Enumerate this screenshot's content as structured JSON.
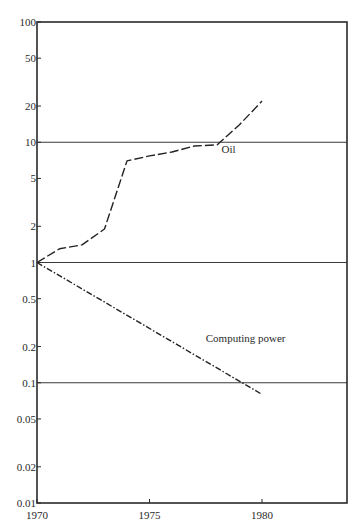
{
  "chart_data": {
    "type": "line",
    "title": "",
    "xlabel": "",
    "ylabel": "",
    "yscale": "log",
    "xlim": [
      1970,
      1984
    ],
    "ylim": [
      0.01,
      100
    ],
    "grid": "horizontal lines at 1-decade marks (10, 1, 0.1)",
    "x_ticks": [
      1970,
      1975,
      1980
    ],
    "x_tick_labels": [
      "1970",
      "1975",
      "1980"
    ],
    "y_ticks": [
      100,
      50,
      20,
      10,
      5,
      2,
      1,
      0.5,
      0.2,
      0.1,
      0.05,
      0.02,
      0.01
    ],
    "y_tick_labels": [
      "100",
      "50",
      "20",
      "10",
      "5",
      "2",
      "1",
      "0.5",
      "0.2",
      "0.1",
      "0.05",
      "0.02",
      "0.01"
    ],
    "reference_lines": [
      10,
      1,
      0.1
    ],
    "series": [
      {
        "name": "Oil",
        "style": "dashed",
        "x": [
          1970,
          1971,
          1972,
          1973,
          1974,
          1975,
          1976,
          1977,
          1978,
          1979,
          1980
        ],
        "values": [
          1.0,
          1.3,
          1.4,
          1.9,
          7.0,
          7.7,
          8.3,
          9.3,
          9.5,
          14,
          22
        ]
      },
      {
        "name": "Computing power",
        "style": "dash-dot",
        "x": [
          1970,
          1980
        ],
        "values": [
          1.0,
          0.08
        ]
      }
    ],
    "annotations": [
      {
        "text": "Oil",
        "x": 1978.2,
        "y": 8.2
      },
      {
        "text": "Computing power",
        "x": 1977.5,
        "y": 0.22
      }
    ]
  },
  "plot": {
    "left": 37,
    "right": 347,
    "top": 22,
    "bottom": 503,
    "x0": 1970,
    "px_per_year": 22.5
  }
}
